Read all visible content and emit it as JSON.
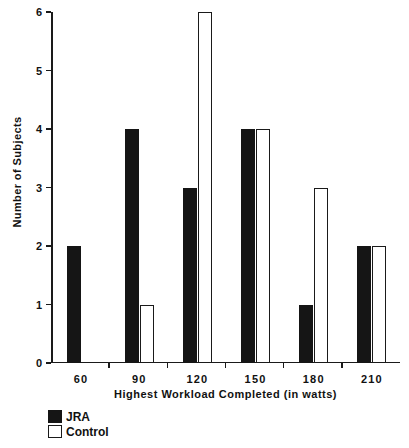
{
  "chart_data": {
    "type": "bar",
    "title": "",
    "xlabel": "Highest Workload Completed (in watts)",
    "ylabel": "Number of Subjects",
    "categories": [
      "60",
      "90",
      "120",
      "150",
      "180",
      "210"
    ],
    "series": [
      {
        "name": "JRA",
        "color": "#151515",
        "style": "filled",
        "values": [
          2,
          4,
          3,
          4,
          1,
          2
        ]
      },
      {
        "name": "Control",
        "color": "#ffffff",
        "style": "open",
        "values": [
          0,
          1,
          6,
          4,
          3,
          2
        ]
      }
    ],
    "ylim": [
      0,
      6
    ],
    "yticks": [
      0,
      1,
      2,
      3,
      4,
      5,
      6
    ],
    "ytick_labels": [
      "0",
      "1",
      "2",
      "3",
      "4",
      "5",
      "6"
    ],
    "grid": false,
    "legend_position": "below-axis-left",
    "axis_color": "#1a1a1a",
    "background": "#ffffff"
  },
  "legend": {
    "items": [
      {
        "label": "JRA",
        "swatch": "filled-square-icon"
      },
      {
        "label": "Control",
        "swatch": "open-square-icon"
      }
    ]
  }
}
